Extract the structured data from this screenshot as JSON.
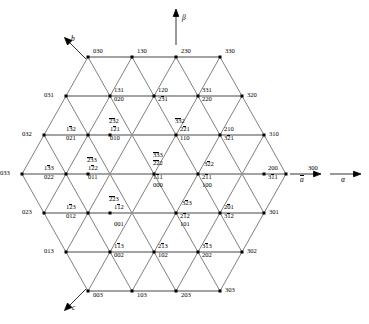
{
  "figure": {
    "type": "crystallographic-lattice-diagram",
    "axes": [
      {
        "name": "beta-axis",
        "label": "β",
        "direction": "up",
        "style": "italic-greek"
      },
      {
        "name": "alpha-axis",
        "label": "α",
        "direction": "right",
        "style": "italic-greek"
      },
      {
        "name": "a-axis",
        "label": "a",
        "direction": "right",
        "overline": true
      },
      {
        "name": "b-axis",
        "label": "b",
        "direction": "upper-left",
        "overline": false
      },
      {
        "name": "c-axis",
        "label": "c",
        "direction": "lower-left",
        "overline": false
      }
    ],
    "colors": {
      "line": "#3a3a3a",
      "highlight_row": "#8c8c8c",
      "vertex": "#000000",
      "background": "#ffffff"
    }
  },
  "nodes": [
    {
      "id": "n-030",
      "x": 88,
      "y": 57,
      "labels": [
        {
          "t": "030",
          "pos": "right-up",
          "bars": []
        }
      ]
    },
    {
      "id": "n-130",
      "x": 132,
      "y": 57,
      "labels": [
        {
          "t": "130",
          "pos": "right-up",
          "bars": []
        }
      ]
    },
    {
      "id": "n-230",
      "x": 176,
      "y": 57,
      "labels": [
        {
          "t": "230",
          "pos": "right-up",
          "bars": []
        }
      ]
    },
    {
      "id": "n-330",
      "x": 220,
      "y": 57,
      "labels": [
        {
          "t": "330",
          "pos": "right-up",
          "bars": []
        }
      ]
    },
    {
      "id": "n-031",
      "x": 66,
      "y": 96,
      "labels": [
        {
          "t": "031",
          "pos": "left",
          "bars": []
        }
      ]
    },
    {
      "id": "n-131-020",
      "x": 110,
      "y": 96,
      "labels": [
        {
          "t": "131",
          "pos": "ru",
          "bars": []
        },
        {
          "t": "020",
          "pos": "rd",
          "bars": []
        }
      ]
    },
    {
      "id": "n-120-231",
      "x": 154,
      "y": 96,
      "labels": [
        {
          "t": "120",
          "pos": "ru",
          "bars": []
        },
        {
          "t": "231",
          "pos": "rd",
          "bars": [
            1
          ]
        }
      ]
    },
    {
      "id": "n-331-220",
      "x": 198,
      "y": 96,
      "labels": [
        {
          "t": "331",
          "pos": "ru",
          "bars": []
        },
        {
          "t": "220",
          "pos": "rd",
          "bars": []
        }
      ]
    },
    {
      "id": "n-320",
      "x": 242,
      "y": 96,
      "labels": [
        {
          "t": "320",
          "pos": "right",
          "bars": []
        }
      ]
    },
    {
      "id": "n-032",
      "x": 44,
      "y": 135,
      "labels": [
        {
          "t": "032",
          "pos": "left",
          "bars": []
        }
      ]
    },
    {
      "id": "n-132-021",
      "x": 88,
      "y": 135,
      "labels": [
        {
          "t": "132",
          "pos": "lu",
          "bars": [
            1
          ]
        },
        {
          "t": "021",
          "pos": "ld",
          "bars": []
        }
      ]
    },
    {
      "id": "n-232-121-010",
      "x": 110,
      "y": 135,
      "labels": [
        {
          "t": "232",
          "pos": "above",
          "bars": [
            0,
            1
          ]
        },
        {
          "t": "121",
          "pos": "lu2",
          "bars": [
            1
          ]
        },
        {
          "t": "010",
          "pos": "ld2",
          "bars": []
        }
      ]
    },
    {
      "id": "n-332-221-110",
      "x": 176,
      "y": 135,
      "labels": [
        {
          "t": "332",
          "pos": "above",
          "bars": [
            0,
            1
          ]
        },
        {
          "t": "221",
          "pos": "ru",
          "bars": [
            1
          ]
        },
        {
          "t": "110",
          "pos": "rd",
          "bars": []
        }
      ]
    },
    {
      "id": "n-210-321",
      "x": 220,
      "y": 135,
      "labels": [
        {
          "t": "210",
          "pos": "ru",
          "bars": []
        },
        {
          "t": "321",
          "pos": "rd",
          "bars": [
            1
          ]
        }
      ]
    },
    {
      "id": "n-310",
      "x": 264,
      "y": 135,
      "labels": [
        {
          "t": "310",
          "pos": "right",
          "bars": []
        }
      ]
    },
    {
      "id": "n-033",
      "x": 22,
      "y": 174,
      "labels": [
        {
          "t": "033",
          "pos": "left",
          "bars": []
        }
      ]
    },
    {
      "id": "n-133-022",
      "x": 66,
      "y": 174,
      "labels": [
        {
          "t": "133",
          "pos": "lu",
          "bars": [
            1
          ]
        },
        {
          "t": "022",
          "pos": "ld",
          "bars": []
        }
      ]
    },
    {
      "id": "n-233-122-011",
      "x": 88,
      "y": 174,
      "labels": [
        {
          "t": "233",
          "pos": "above",
          "bars": [
            0,
            1
          ]
        },
        {
          "t": "122",
          "pos": "lu2",
          "bars": [
            1
          ]
        },
        {
          "t": "011",
          "pos": "ld2",
          "bars": []
        }
      ]
    },
    {
      "id": "n-333-222-111-000",
      "x": 154,
      "y": 174,
      "labels": [
        {
          "t": "333",
          "pos": "stack0",
          "bars": [
            0,
            1
          ]
        },
        {
          "t": "222",
          "pos": "stack1",
          "bars": [
            0,
            1
          ]
        },
        {
          "t": "111",
          "pos": "stack2",
          "bars": [
            1
          ]
        },
        {
          "t": "000",
          "pos": "stack3",
          "bars": []
        }
      ]
    },
    {
      "id": "n-322-211-100",
      "x": 198,
      "y": 174,
      "labels": [
        {
          "t": "322",
          "pos": "ru-hi",
          "bars": [
            1
          ]
        },
        {
          "t": "211",
          "pos": "rd",
          "bars": [
            1
          ]
        },
        {
          "t": "100",
          "pos": "rd2",
          "bars": []
        }
      ]
    },
    {
      "id": "n-200-311",
      "x": 264,
      "y": 174,
      "labels": [
        {
          "t": "200",
          "pos": "ru",
          "bars": []
        },
        {
          "t": "311",
          "pos": "rd",
          "bars": [
            1
          ]
        }
      ]
    },
    {
      "id": "n-300",
      "x": 286,
      "y": 174,
      "labels": [
        {
          "t": "300",
          "pos": "ru2",
          "bars": []
        }
      ]
    },
    {
      "id": "n-023",
      "x": 44,
      "y": 213,
      "labels": [
        {
          "t": "023",
          "pos": "left",
          "bars": []
        }
      ]
    },
    {
      "id": "n-123-012",
      "x": 88,
      "y": 213,
      "labels": [
        {
          "t": "123",
          "pos": "lu",
          "bars": [
            1
          ]
        },
        {
          "t": "012",
          "pos": "ld",
          "bars": []
        }
      ]
    },
    {
      "id": "n-223-112-001",
      "x": 110,
      "y": 213,
      "labels": [
        {
          "t": "223",
          "pos": "above",
          "bars": [
            0,
            1
          ]
        },
        {
          "t": "112",
          "pos": "ru",
          "bars": [
            1
          ]
        },
        {
          "t": "001",
          "pos": "rd2",
          "bars": []
        }
      ]
    },
    {
      "id": "n-323-212-101",
      "x": 176,
      "y": 213,
      "labels": [
        {
          "t": "323",
          "pos": "ru-hi",
          "bars": [
            1
          ]
        },
        {
          "t": "212",
          "pos": "rd",
          "bars": [
            1
          ]
        },
        {
          "t": "101",
          "pos": "rd2",
          "bars": []
        }
      ]
    },
    {
      "id": "n-201-312",
      "x": 220,
      "y": 213,
      "labels": [
        {
          "t": "201",
          "pos": "ru",
          "bars": [
            1
          ]
        },
        {
          "t": "312",
          "pos": "rd",
          "bars": [
            1
          ]
        }
      ]
    },
    {
      "id": "n-301",
      "x": 264,
      "y": 213,
      "labels": [
        {
          "t": "301",
          "pos": "right",
          "bars": []
        }
      ]
    },
    {
      "id": "n-013",
      "x": 66,
      "y": 252,
      "labels": [
        {
          "t": "013",
          "pos": "left",
          "bars": []
        }
      ]
    },
    {
      "id": "n-113-002",
      "x": 110,
      "y": 252,
      "labels": [
        {
          "t": "113",
          "pos": "ru",
          "bars": [
            1
          ]
        },
        {
          "t": "002",
          "pos": "rd",
          "bars": []
        }
      ]
    },
    {
      "id": "n-213-102",
      "x": 154,
      "y": 252,
      "labels": [
        {
          "t": "213",
          "pos": "ru",
          "bars": [
            1
          ]
        },
        {
          "t": "102",
          "pos": "rd",
          "bars": []
        }
      ]
    },
    {
      "id": "n-313-202",
      "x": 198,
      "y": 252,
      "labels": [
        {
          "t": "313",
          "pos": "ru",
          "bars": [
            1
          ]
        },
        {
          "t": "202",
          "pos": "rd",
          "bars": []
        }
      ]
    },
    {
      "id": "n-302",
      "x": 242,
      "y": 252,
      "labels": [
        {
          "t": "302",
          "pos": "right",
          "bars": []
        }
      ]
    },
    {
      "id": "n-003",
      "x": 88,
      "y": 291,
      "labels": [
        {
          "t": "003",
          "pos": "right-dn",
          "bars": []
        }
      ]
    },
    {
      "id": "n-103",
      "x": 132,
      "y": 291,
      "labels": [
        {
          "t": "103",
          "pos": "right-dn",
          "bars": []
        }
      ]
    },
    {
      "id": "n-203",
      "x": 176,
      "y": 291,
      "labels": [
        {
          "t": "203",
          "pos": "right-dn",
          "bars": []
        }
      ]
    },
    {
      "id": "n-303",
      "x": 220,
      "y": 291,
      "labels": [
        {
          "t": "303",
          "pos": "right",
          "bars": []
        }
      ]
    }
  ]
}
